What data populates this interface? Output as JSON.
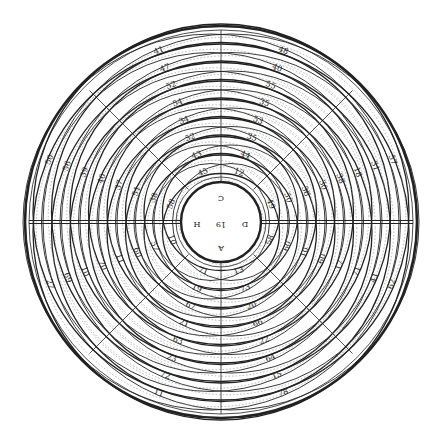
{
  "diagram": {
    "type": "concentric-circles-plate",
    "colors": {
      "background": "#ffffff",
      "ink": "#222222",
      "faint": "#888888"
    },
    "center": {
      "x": 221,
      "y": 222
    },
    "outer_radius": 196,
    "inner_radius": 40,
    "center_labels": {
      "top": "C",
      "bottom": "A",
      "left": "H",
      "right": "D",
      "middle": "19"
    },
    "quadrants": {
      "top_left_row": [
        "41",
        "47",
        "52",
        "54",
        "34",
        "52",
        "43",
        "45"
      ],
      "top_right_row": [
        "48",
        "40",
        "55",
        "35",
        "53",
        "35",
        "44",
        "12"
      ],
      "left_upper_col": [
        "50",
        "56",
        "39",
        "40",
        "37",
        "51",
        "38",
        "58"
      ],
      "right_upper_col": [
        "57",
        "31",
        "18",
        "38",
        "30",
        "36",
        "50",
        "49"
      ],
      "left_lower_col": [
        "27",
        "69",
        "10",
        "70",
        "11",
        "60",
        "57",
        "10"
      ],
      "right_lower_col": [
        "62",
        "41",
        "71",
        "17",
        "60",
        "10",
        "60",
        "58"
      ],
      "bottom_left_row": [
        "11",
        "72",
        "23",
        "63",
        "21",
        "67",
        "19",
        "71"
      ],
      "bottom_right_row": [
        "78",
        "15",
        "64",
        "22",
        "66",
        "20",
        "73",
        "13"
      ]
    }
  }
}
